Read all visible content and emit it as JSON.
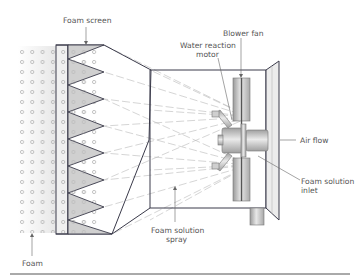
{
  "diagram": {
    "labels": {
      "foam_screen": "Foam screen",
      "blower_fan": "Blower fan",
      "water_reaction_motor_line1": "Water reaction",
      "water_reaction_motor_line2": "motor",
      "air_flow": "Air flow",
      "foam_solution_inlet_line1": "Foam solution",
      "foam_solution_inlet_line2": "inlet",
      "foam_solution_spray_line1": "Foam solution",
      "foam_solution_spray_line2": "spray",
      "foam": "Foam"
    },
    "colors": {
      "line": "#3a3a4a",
      "spray": "#b8b8b8",
      "triangle_fill": "#d0d0d0",
      "metal_light": "#e2e2e2",
      "metal_dark": "#9a9a9a",
      "foam_bubble": "#a0a0a0",
      "label_text": "#555555"
    }
  }
}
